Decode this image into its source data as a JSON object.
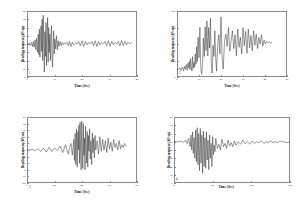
{
  "figure": {
    "background": "#ffffff",
    "trace_color": "#1a1a1a",
    "axis_color": "#8a8a8a",
    "layout": "2x2 grid of time-history line plots"
  },
  "chart_data": [
    {
      "type": "line",
      "panel": "top-left",
      "panel_number": "1",
      "title": "",
      "xlabel": "Time (Sec)",
      "ylabel": "Bending moment (kN-m)",
      "xlim": [
        0,
        40
      ],
      "ylim": [
        0,
        80
      ],
      "xticks": [
        0,
        10,
        20,
        30,
        40
      ],
      "yticks": [
        0,
        10,
        20,
        30,
        40,
        50,
        60,
        70,
        80
      ],
      "xticklabels": [
        "0",
        "10",
        "20",
        "30",
        "40"
      ],
      "yticklabels": [
        "0",
        "10",
        "20",
        "30",
        "40",
        "50",
        "60",
        "70",
        "80"
      ],
      "grid": false,
      "legend": "none",
      "series": [
        {
          "name": "bending moment",
          "x": [
            0,
            0.4,
            0.8,
            1.2,
            1.6,
            2,
            2.3,
            2.6,
            2.9,
            3.2,
            3.5,
            3.8,
            4.1,
            4.3,
            4.5,
            4.7,
            4.9,
            5.1,
            5.3,
            5.5,
            5.7,
            5.9,
            6.1,
            6.3,
            6.5,
            6.7,
            6.9,
            7.1,
            7.3,
            7.5,
            7.7,
            7.9,
            8.1,
            8.3,
            8.5,
            8.7,
            8.9,
            9.1,
            9.3,
            9.5,
            9.7,
            9.9,
            10.1,
            10.4,
            10.7,
            11,
            11.3,
            11.6,
            12,
            12.4,
            12.8,
            13.2,
            13.6,
            14,
            14.5,
            15,
            15.5,
            16,
            16.5,
            17,
            17.6,
            18.2,
            18.8,
            19.4,
            20,
            20.6,
            21.2,
            21.8,
            22.4,
            23,
            23.6,
            24.2,
            24.8,
            25.4,
            26,
            26.6,
            27.2,
            27.8,
            28.4,
            29,
            29.6,
            30.2,
            30.8,
            31.4,
            32,
            32.6,
            33.2,
            33.8,
            34.4,
            35,
            35.6,
            36.2,
            36.8,
            37.4,
            38
          ],
          "y": [
            40,
            39,
            41,
            38,
            42,
            37,
            43,
            36,
            45,
            33,
            47,
            30,
            52,
            27,
            58,
            24,
            49,
            62,
            31,
            70,
            20,
            75,
            38,
            6,
            55,
            25,
            66,
            14,
            48,
            72,
            18,
            60,
            30,
            52,
            20,
            44,
            62,
            24,
            12,
            38,
            56,
            28,
            46,
            34,
            50,
            33,
            44,
            37,
            43,
            38,
            42,
            39,
            41,
            40,
            42,
            38,
            43,
            37,
            42,
            39,
            41,
            40,
            43,
            38,
            44,
            37,
            43,
            39,
            42,
            40,
            43,
            38,
            44,
            37,
            43,
            39,
            42,
            40,
            43,
            38,
            44,
            37,
            43,
            39,
            42,
            40,
            43,
            38,
            44,
            38,
            43,
            39,
            42,
            40,
            42
          ]
        }
      ]
    },
    {
      "type": "line",
      "panel": "top-right",
      "panel_number": "2",
      "title": "",
      "xlabel": "Time (Sec)",
      "ylabel": "Bending moment (kN-m)",
      "xlim": [
        0,
        50
      ],
      "ylim": [
        0,
        200
      ],
      "xticks": [
        0,
        10,
        20,
        30,
        40,
        50
      ],
      "yticks": [
        0,
        50,
        100,
        150,
        200
      ],
      "xticklabels": [
        "0",
        "10",
        "20",
        "30",
        "40",
        "50"
      ],
      "yticklabels": [
        "0",
        "50",
        "100",
        "150",
        "200"
      ],
      "grid": false,
      "legend": "none",
      "series": [
        {
          "name": "bending moment",
          "x": [
            0,
            0.6,
            1.2,
            1.8,
            2.4,
            3,
            3.4,
            3.8,
            4.2,
            4.6,
            5,
            5.3,
            5.6,
            5.9,
            6.2,
            6.5,
            6.8,
            7.1,
            7.4,
            7.7,
            8,
            8.3,
            8.6,
            8.9,
            9.2,
            9.6,
            10,
            10.4,
            10.8,
            11.2,
            11.6,
            12,
            12.4,
            12.8,
            13.2,
            13.6,
            14,
            14.4,
            14.8,
            15.2,
            15.6,
            16,
            16.4,
            16.8,
            17.2,
            17.6,
            18,
            18.5,
            19,
            19.5,
            20,
            20.5,
            21,
            21.6,
            22.2,
            22.8,
            23.4,
            24,
            24.6,
            25.2,
            25.8,
            26.4,
            27,
            27.6,
            28.2,
            28.8,
            29.4,
            30,
            30.6,
            31.2,
            31.8,
            32.4,
            33,
            33.6,
            34.2,
            34.8,
            35.4,
            36,
            36.6,
            37.2,
            37.8,
            38.4,
            39,
            39.6,
            40.2,
            40.8,
            41.4,
            42,
            42.6,
            43
          ],
          "y": [
            25,
            22,
            28,
            20,
            30,
            18,
            32,
            24,
            38,
            20,
            42,
            28,
            48,
            22,
            56,
            30,
            18,
            62,
            26,
            44,
            30,
            70,
            38,
            92,
            46,
            120,
            58,
            150,
            30,
            8,
            35,
            118,
            62,
            152,
            80,
            170,
            64,
            150,
            88,
            178,
            40,
            12,
            96,
            62,
            140,
            58,
            18,
            100,
            128,
            70,
            182,
            60,
            24,
            108,
            130,
            92,
            150,
            78,
            110,
            140,
            86,
            128,
            64,
            145,
            90,
            120,
            70,
            150,
            95,
            138,
            72,
            146,
            88,
            126,
            80,
            140,
            96,
            130,
            86,
            120,
            100,
            128,
            94,
            112,
            100,
            108,
            104,
            106,
            102,
            105
          ]
        }
      ]
    },
    {
      "type": "line",
      "panel": "bottom-left",
      "panel_number": "3",
      "title": "",
      "xlabel": "Time (Sec)",
      "ylabel": "Bending moment (kN-m)",
      "xlim": [
        0,
        80
      ],
      "ylim": [
        -20,
        80
      ],
      "xticks": [
        0,
        20,
        40,
        60,
        80
      ],
      "yticks": [
        -20,
        -10,
        0,
        10,
        20,
        30,
        40,
        50,
        60,
        70,
        80
      ],
      "xticklabels": [
        "0",
        "20",
        "40",
        "60",
        "80"
      ],
      "yticklabels": [
        "-20",
        "-10",
        "0",
        "10",
        "20",
        "30",
        "40",
        "50",
        "60",
        "70",
        "80"
      ],
      "grid": false,
      "legend": "none",
      "series": [
        {
          "name": "bending moment",
          "x": [
            0,
            2,
            4,
            6,
            8,
            10,
            12,
            14,
            16,
            18,
            20,
            22,
            24,
            26,
            28,
            29,
            30,
            31,
            32,
            33,
            34,
            34.5,
            35,
            35.5,
            36,
            36.5,
            37,
            37.4,
            37.8,
            38.2,
            38.6,
            39,
            39.4,
            39.8,
            40.2,
            40.6,
            41,
            41.4,
            41.8,
            42.2,
            42.6,
            43,
            43.4,
            43.8,
            44.2,
            44.6,
            45,
            45.5,
            46,
            46.5,
            47,
            47.5,
            48,
            48.5,
            49,
            49.5,
            50,
            51,
            52,
            53,
            54,
            55,
            56,
            57,
            58,
            59,
            60,
            61,
            62,
            63,
            64,
            65,
            66,
            67,
            68,
            69,
            70,
            71,
            72
          ],
          "y": [
            30,
            30,
            31,
            29,
            32,
            28,
            33,
            27,
            34,
            28,
            33,
            29,
            36,
            26,
            38,
            30,
            24,
            34,
            40,
            22,
            46,
            14,
            55,
            8,
            62,
            4,
            58,
            30,
            68,
            10,
            72,
            26,
            0,
            74,
            36,
            2,
            70,
            22,
            48,
            0,
            66,
            30,
            10,
            58,
            4,
            52,
            28,
            62,
            16,
            44,
            8,
            56,
            26,
            48,
            18,
            52,
            30,
            44,
            24,
            50,
            28,
            46,
            30,
            44,
            26,
            48,
            32,
            42,
            28,
            46,
            34,
            40,
            30,
            44,
            32,
            38,
            34,
            40,
            36
          ]
        }
      ]
    },
    {
      "type": "line",
      "panel": "bottom-right",
      "panel_number": "4",
      "title": "",
      "xlabel": "Time (Sec)",
      "ylabel": "Bending moment (kN-m)",
      "xlim": [
        0,
        150
      ],
      "ylim": [
        0,
        80
      ],
      "xticks": [
        0,
        50,
        100,
        150
      ],
      "yticks": [
        0,
        10,
        20,
        30,
        40,
        50,
        60,
        70,
        80
      ],
      "xticklabels": [
        "0",
        "50",
        "100",
        "150"
      ],
      "yticklabels": [
        "0",
        "10",
        "20",
        "30",
        "40",
        "50",
        "60",
        "70",
        "80"
      ],
      "grid": false,
      "legend": "none",
      "series": [
        {
          "name": "bending moment",
          "x": [
            0,
            3,
            6,
            9,
            12,
            15,
            17,
            19,
            21,
            22,
            23,
            24,
            25,
            26,
            27,
            28,
            29,
            30,
            31,
            32,
            33,
            34,
            35,
            36,
            37,
            38,
            39,
            40,
            41,
            42,
            43,
            44,
            45,
            46,
            47,
            48,
            49,
            50,
            51,
            52,
            53,
            54,
            56,
            58,
            60,
            62,
            64,
            66,
            68,
            70,
            72,
            74,
            76,
            78,
            80,
            83,
            86,
            89,
            92,
            95,
            98,
            101,
            104,
            107,
            110,
            113,
            116,
            119,
            122,
            125,
            128,
            131,
            134,
            137,
            140,
            143,
            146,
            150
          ],
          "y": [
            50,
            50,
            50,
            51,
            49,
            52,
            48,
            54,
            44,
            58,
            40,
            62,
            36,
            55,
            30,
            64,
            26,
            67,
            22,
            60,
            15,
            66,
            24,
            58,
            12,
            63,
            20,
            55,
            18,
            62,
            28,
            52,
            16,
            58,
            30,
            48,
            20,
            56,
            34,
            46,
            38,
            54,
            42,
            47,
            40,
            53,
            44,
            48,
            42,
            52,
            45,
            49,
            44,
            51,
            46,
            50,
            47,
            52,
            48,
            50,
            47,
            51,
            48,
            50,
            49,
            51,
            48,
            50,
            49,
            51,
            49,
            50,
            49,
            51,
            50,
            50,
            49,
            50
          ]
        }
      ]
    }
  ]
}
